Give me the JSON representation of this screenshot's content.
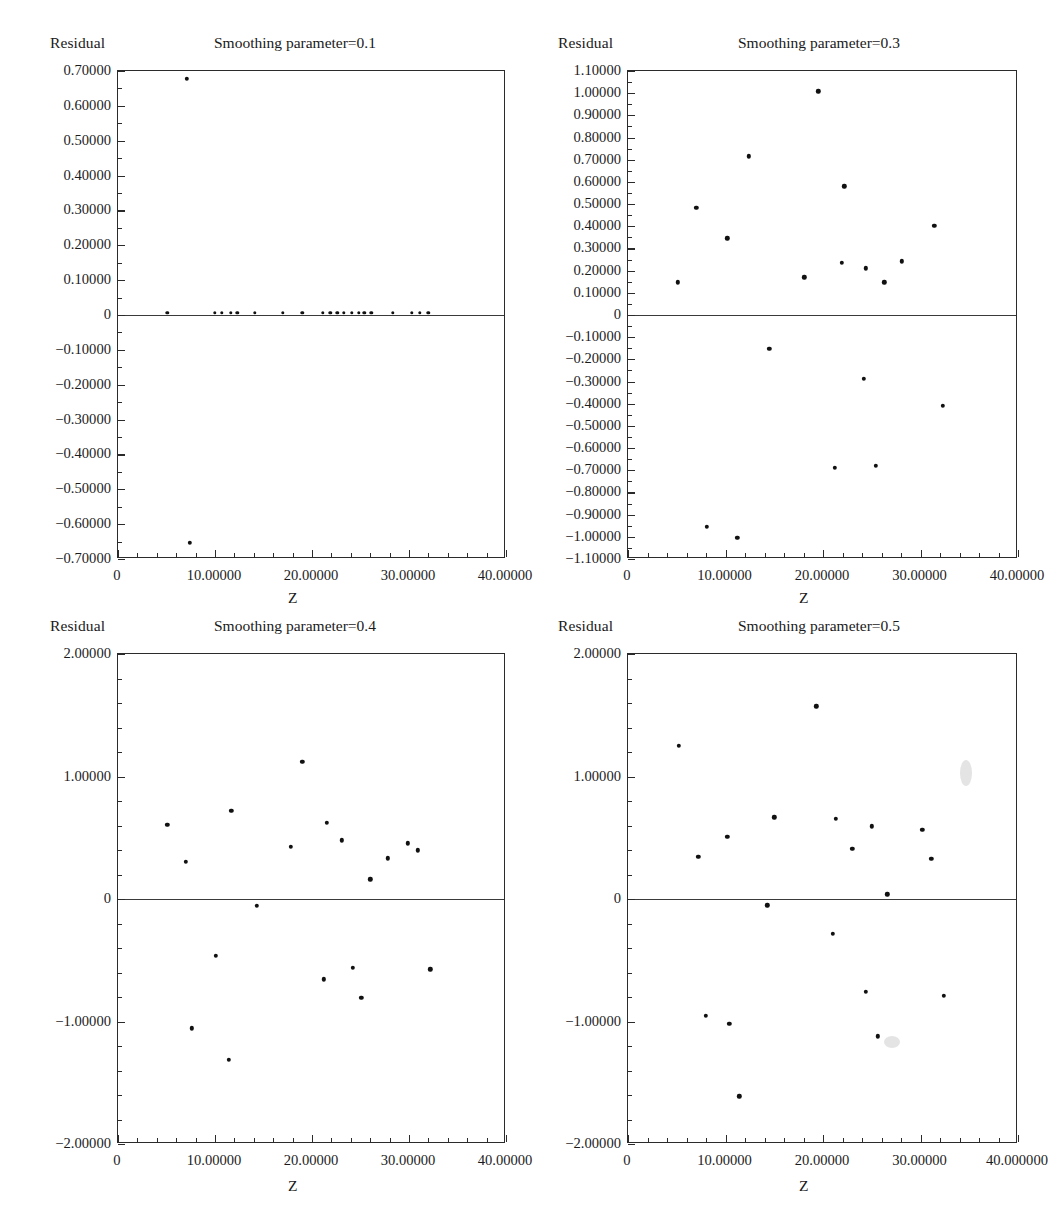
{
  "figure": {
    "panel_count": 4,
    "y_axis_name": "Residual",
    "x_axis_name": "Z"
  },
  "chart_data": [
    {
      "type": "scatter",
      "title": "Smoothing parameter=0.1",
      "xlabel": "Z",
      "ylabel": "Residual",
      "xlim": [
        0,
        40
      ],
      "ylim": [
        -0.7,
        0.7
      ],
      "grid": false,
      "legend": "none",
      "xticks": [
        0,
        10,
        20,
        30,
        40
      ],
      "xticklabels": [
        "0",
        "10.00000",
        "20.00000",
        "30.00000",
        "40.00000"
      ],
      "yticks": [
        0.7,
        0.6,
        0.5,
        0.4,
        0.3,
        0.2,
        0.1,
        0,
        -0.1,
        -0.2,
        -0.3,
        -0.4,
        -0.5,
        -0.6,
        -0.7
      ],
      "yticklabels": [
        "0.70000",
        "0.60000",
        "0.50000",
        "0.40000",
        "0.30000",
        "0.20000",
        "0.10000",
        "0",
        "−0.10000",
        "−0.20000",
        "−0.30000",
        "−0.40000",
        "−0.50000",
        "−0.60000",
        "−0.70000"
      ],
      "points": [
        {
          "x": 7.1,
          "y": 0.678
        },
        {
          "x": 7.4,
          "y": -0.653
        },
        {
          "x": 5.1,
          "y": 0.006
        },
        {
          "x": 10.0,
          "y": 0.006
        },
        {
          "x": 10.7,
          "y": 0.006
        },
        {
          "x": 11.6,
          "y": 0.006
        },
        {
          "x": 12.3,
          "y": 0.006
        },
        {
          "x": 14.1,
          "y": 0.006
        },
        {
          "x": 17.0,
          "y": 0.006
        },
        {
          "x": 19.0,
          "y": 0.006
        },
        {
          "x": 21.1,
          "y": 0.006
        },
        {
          "x": 21.9,
          "y": 0.006
        },
        {
          "x": 22.6,
          "y": 0.006
        },
        {
          "x": 23.3,
          "y": 0.006
        },
        {
          "x": 24.1,
          "y": 0.006
        },
        {
          "x": 24.8,
          "y": 0.006
        },
        {
          "x": 25.4,
          "y": 0.006
        },
        {
          "x": 26.1,
          "y": 0.006
        },
        {
          "x": 28.3,
          "y": 0.006
        },
        {
          "x": 30.3,
          "y": 0.006
        },
        {
          "x": 31.1,
          "y": 0.006
        },
        {
          "x": 32.0,
          "y": 0.006
        }
      ]
    },
    {
      "type": "scatter",
      "title": "Smoothing parameter=0.3",
      "xlabel": "Z",
      "ylabel": "Residual",
      "xlim": [
        0,
        40
      ],
      "ylim": [
        -1.1,
        1.1
      ],
      "grid": false,
      "legend": "none",
      "xticks": [
        0,
        10,
        20,
        30,
        40
      ],
      "xticklabels": [
        "0",
        "10.00000",
        "20.00000",
        "30.00000",
        "40.00000"
      ],
      "yticks": [
        1.1,
        1.0,
        0.9,
        0.8,
        0.7,
        0.6,
        0.5,
        0.4,
        0.3,
        0.2,
        0.1,
        0,
        -0.1,
        -0.2,
        -0.3,
        -0.4,
        -0.5,
        -0.6,
        -0.7,
        -0.8,
        -0.9,
        -1.0,
        -1.1
      ],
      "yticklabels": [
        "1.10000",
        "1.00000",
        "0.90000",
        "0.80000",
        "0.70000",
        "0.60000",
        "0.50000",
        "0.40000",
        "0.30000",
        "0.20000",
        "0.10000",
        "0",
        "−0.10000",
        "−0.20000",
        "−0.30000",
        "−0.40000",
        "−0.50000",
        "−0.60000",
        "−0.70000",
        "−0.80000",
        "−0.90000",
        "−1.00000",
        "−1.10000"
      ],
      "points": [
        {
          "x": 5.1,
          "y": 0.147
        },
        {
          "x": 7.0,
          "y": 0.482
        },
        {
          "x": 8.1,
          "y": -0.955
        },
        {
          "x": 10.2,
          "y": 0.345
        },
        {
          "x": 11.2,
          "y": -1.005
        },
        {
          "x": 12.4,
          "y": 0.716
        },
        {
          "x": 14.5,
          "y": -0.152
        },
        {
          "x": 18.1,
          "y": 0.17
        },
        {
          "x": 19.5,
          "y": 1.008
        },
        {
          "x": 21.2,
          "y": -0.688
        },
        {
          "x": 21.9,
          "y": 0.234
        },
        {
          "x": 22.2,
          "y": 0.58
        },
        {
          "x": 24.2,
          "y": -0.288
        },
        {
          "x": 24.4,
          "y": 0.21
        },
        {
          "x": 25.4,
          "y": -0.68
        },
        {
          "x": 26.3,
          "y": 0.147
        },
        {
          "x": 28.1,
          "y": 0.242
        },
        {
          "x": 31.4,
          "y": 0.402
        },
        {
          "x": 32.3,
          "y": -0.408
        }
      ]
    },
    {
      "type": "scatter",
      "title": "Smoothing parameter=0.4",
      "xlabel": "Z",
      "ylabel": "Residual",
      "xlim": [
        0,
        40
      ],
      "ylim": [
        -2.0,
        2.0
      ],
      "grid": false,
      "legend": "none",
      "xticks": [
        0,
        10,
        20,
        30,
        40
      ],
      "xticklabels": [
        "0",
        "10.00000",
        "20.00000",
        "30.00000",
        "40.00000"
      ],
      "yticks": [
        2.0,
        1.0,
        0,
        -1.0,
        -2.0
      ],
      "yticklabels": [
        "2.00000",
        "1.00000",
        "0",
        "−1.00000",
        "−2.00000"
      ],
      "points": [
        {
          "x": 5.1,
          "y": 0.605
        },
        {
          "x": 7.0,
          "y": 0.305
        },
        {
          "x": 7.6,
          "y": -1.055
        },
        {
          "x": 10.1,
          "y": -0.465
        },
        {
          "x": 11.4,
          "y": -1.315
        },
        {
          "x": 11.7,
          "y": 0.722
        },
        {
          "x": 14.3,
          "y": -0.055
        },
        {
          "x": 17.8,
          "y": 0.425
        },
        {
          "x": 19.0,
          "y": 1.118
        },
        {
          "x": 21.2,
          "y": -0.655
        },
        {
          "x": 21.5,
          "y": 0.622
        },
        {
          "x": 23.1,
          "y": 0.478
        },
        {
          "x": 24.2,
          "y": -0.56
        },
        {
          "x": 25.1,
          "y": -0.805
        },
        {
          "x": 26.0,
          "y": 0.16
        },
        {
          "x": 27.8,
          "y": 0.332
        },
        {
          "x": 29.9,
          "y": 0.455
        },
        {
          "x": 30.9,
          "y": 0.398
        },
        {
          "x": 32.2,
          "y": -0.575
        }
      ]
    },
    {
      "type": "scatter",
      "title": "Smoothing parameter=0.5",
      "xlabel": "Z",
      "ylabel": "Residual",
      "xlim": [
        0,
        40
      ],
      "ylim": [
        -2.0,
        2.0
      ],
      "grid": false,
      "legend": "none",
      "xticks": [
        0,
        10,
        20,
        30,
        40
      ],
      "xticklabels": [
        "0",
        "10.00000",
        "20.00000",
        "30.00000",
        "40.000000"
      ],
      "yticks": [
        2.0,
        1.0,
        0,
        -1.0,
        -2.0
      ],
      "yticklabels": [
        "2.00000",
        "1.00000",
        "0",
        "−1.00000",
        "−2.00000"
      ],
      "points": [
        {
          "x": 5.2,
          "y": 1.25
        },
        {
          "x": 7.2,
          "y": 0.345
        },
        {
          "x": 8.0,
          "y": -0.955
        },
        {
          "x": 10.2,
          "y": 0.508
        },
        {
          "x": 10.4,
          "y": -1.02
        },
        {
          "x": 11.4,
          "y": -1.61
        },
        {
          "x": 14.3,
          "y": -0.052
        },
        {
          "x": 15.0,
          "y": 0.668
        },
        {
          "x": 19.3,
          "y": 1.572
        },
        {
          "x": 21.0,
          "y": -0.282
        },
        {
          "x": 21.3,
          "y": 0.655
        },
        {
          "x": 23.0,
          "y": 0.412
        },
        {
          "x": 24.4,
          "y": -0.76
        },
        {
          "x": 25.0,
          "y": 0.595
        },
        {
          "x": 25.6,
          "y": -1.12
        },
        {
          "x": 26.6,
          "y": 0.038
        },
        {
          "x": 30.2,
          "y": 0.565
        },
        {
          "x": 31.1,
          "y": 0.33
        },
        {
          "x": 32.4,
          "y": -0.792
        }
      ]
    }
  ]
}
